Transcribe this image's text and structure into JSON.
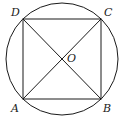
{
  "diagram": {
    "type": "circle-inscribed-square",
    "circle": {
      "cx": 62,
      "cy": 59,
      "r": 56
    },
    "vertices": {
      "A": {
        "label": "A",
        "x": 23,
        "y": 99
      },
      "B": {
        "label": "B",
        "x": 101,
        "y": 99
      },
      "C": {
        "label": "C",
        "x": 101,
        "y": 19
      },
      "D": {
        "label": "D",
        "x": 23,
        "y": 19
      }
    },
    "center": {
      "label": "O",
      "x": 62,
      "y": 59
    },
    "segments": [
      "AB",
      "BC",
      "CD",
      "DA",
      "AC",
      "BD"
    ],
    "stroke_color": "#1a1a1a"
  }
}
